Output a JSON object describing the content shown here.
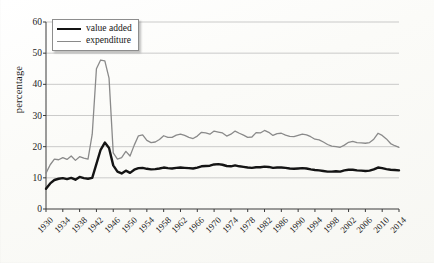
{
  "axes": {
    "ylabel": "percentage",
    "yticks": [
      0,
      10,
      20,
      30,
      40,
      50,
      60
    ],
    "xticks": [
      1930,
      1934,
      1938,
      1942,
      1946,
      1950,
      1954,
      1958,
      1962,
      1966,
      1970,
      1974,
      1978,
      1982,
      1986,
      1990,
      1994,
      1998,
      2002,
      2006,
      2010,
      2014
    ]
  },
  "legend": {
    "items": [
      {
        "label": "value added",
        "color": "#141414"
      },
      {
        "label": "expenditure",
        "color": "#8a8a8a"
      }
    ]
  },
  "chart_data": {
    "type": "line",
    "title": "",
    "xlabel": "",
    "ylabel": "percentage",
    "xlim": [
      1930,
      2014
    ],
    "ylim": [
      0,
      60
    ],
    "grid": true,
    "legend_position": "top-left",
    "x": [
      1930,
      1931,
      1932,
      1933,
      1934,
      1935,
      1936,
      1937,
      1938,
      1939,
      1940,
      1941,
      1942,
      1943,
      1944,
      1945,
      1946,
      1947,
      1948,
      1949,
      1950,
      1951,
      1952,
      1953,
      1954,
      1955,
      1956,
      1957,
      1958,
      1959,
      1960,
      1961,
      1962,
      1963,
      1964,
      1965,
      1966,
      1967,
      1968,
      1969,
      1970,
      1971,
      1972,
      1973,
      1974,
      1975,
      1976,
      1977,
      1978,
      1979,
      1980,
      1981,
      1982,
      1983,
      1984,
      1985,
      1986,
      1987,
      1988,
      1989,
      1990,
      1991,
      1992,
      1993,
      1994,
      1995,
      1996,
      1997,
      1998,
      1999,
      2000,
      2001,
      2002,
      2003,
      2004,
      2005,
      2006,
      2007,
      2008,
      2009,
      2010,
      2011,
      2012,
      2013,
      2014
    ],
    "series": [
      {
        "name": "value added",
        "color": "#141414",
        "width": 2.4,
        "values": [
          6.5,
          8.2,
          9.3,
          9.7,
          9.9,
          9.6,
          10.0,
          9.4,
          10.3,
          9.9,
          9.7,
          10.0,
          14.5,
          19.0,
          21.3,
          19.6,
          14.0,
          12.0,
          11.4,
          12.3,
          11.6,
          12.6,
          13.1,
          13.2,
          12.9,
          12.7,
          12.8,
          13.0,
          13.3,
          13.1,
          13.0,
          13.2,
          13.3,
          13.2,
          13.1,
          13.0,
          13.3,
          13.7,
          13.8,
          13.9,
          14.3,
          14.4,
          14.2,
          13.8,
          13.7,
          14.0,
          13.7,
          13.5,
          13.3,
          13.2,
          13.4,
          13.4,
          13.6,
          13.5,
          13.2,
          13.3,
          13.3,
          13.2,
          13.0,
          12.9,
          13.0,
          13.1,
          13.0,
          12.7,
          12.5,
          12.4,
          12.2,
          12.0,
          12.0,
          12.1,
          12.0,
          12.4,
          12.6,
          12.6,
          12.4,
          12.3,
          12.2,
          12.3,
          12.7,
          13.3,
          13.1,
          12.8,
          12.6,
          12.5,
          12.4
        ]
      },
      {
        "name": "expenditure",
        "color": "#8a8a8a",
        "width": 1.3,
        "values": [
          11.5,
          14.2,
          16.0,
          15.8,
          16.5,
          15.9,
          17.0,
          15.6,
          16.8,
          16.3,
          16.0,
          24.0,
          45.0,
          47.8,
          47.5,
          42.0,
          18.0,
          16.0,
          16.5,
          18.5,
          17.0,
          20.5,
          23.5,
          23.8,
          22.0,
          21.3,
          21.5,
          22.3,
          23.5,
          23.0,
          23.0,
          23.7,
          24.0,
          23.6,
          23.0,
          22.6,
          23.4,
          24.6,
          24.4,
          24.0,
          25.0,
          24.7,
          24.4,
          23.4,
          24.0,
          25.0,
          24.3,
          23.7,
          23.0,
          23.1,
          24.5,
          24.4,
          25.2,
          24.6,
          23.6,
          24.2,
          24.3,
          23.7,
          23.3,
          23.2,
          23.6,
          24.0,
          23.8,
          23.2,
          22.4,
          22.2,
          21.5,
          20.7,
          20.2,
          20.0,
          19.8,
          20.5,
          21.4,
          21.7,
          21.3,
          21.2,
          21.1,
          21.3,
          22.4,
          24.3,
          23.6,
          22.5,
          21.0,
          20.3,
          19.8
        ]
      }
    ]
  }
}
